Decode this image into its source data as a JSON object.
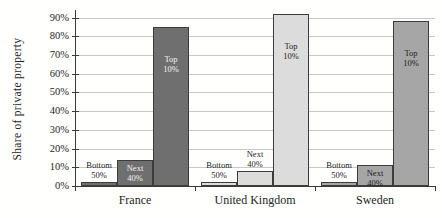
{
  "chart_data": {
    "type": "bar",
    "title": "",
    "xlabel": "",
    "ylabel": "Share of private property",
    "ylim": [
      0,
      95
    ],
    "yticks": [
      0,
      10,
      20,
      30,
      40,
      50,
      60,
      70,
      80,
      90
    ],
    "ytick_suffix": "%",
    "grid": true,
    "legend_position": "none (labels drawn on bars)",
    "categories": [
      "France",
      "United Kingdom",
      "Sweden"
    ],
    "series": [
      {
        "name": "Bottom 50%",
        "label_lines": [
          "Bottom",
          "50%"
        ],
        "values": [
          2,
          2,
          2
        ]
      },
      {
        "name": "Next 40%",
        "label_lines": [
          "Next",
          "40%"
        ],
        "values": [
          14,
          8,
          11
        ]
      },
      {
        "name": "Top 10%",
        "label_lines": [
          "Top",
          "10%"
        ],
        "values": [
          85,
          92,
          88
        ]
      }
    ],
    "group_colors": [
      "#6f6f6f",
      "#dcdcdc",
      "#a6a6a6"
    ],
    "bar_border_color": "#3c3c3c",
    "gridline_color": "#c7c7c3",
    "axis_color": "#3a3a3a",
    "label_layout": [
      [
        "above",
        "inside-top",
        "inside-mid"
      ],
      [
        "above",
        "above",
        "inside-mid"
      ],
      [
        "above",
        "inside-top",
        "inside-mid"
      ]
    ],
    "label_colors": [
      [
        "#1d1d1d",
        "#f2f2f2",
        "#f2f2f2"
      ],
      [
        "#1d1d1d",
        "#1d1d1d",
        "#1d1d1d"
      ],
      [
        "#1d1d1d",
        "#1d1d1d",
        "#1d1d1d"
      ]
    ]
  }
}
